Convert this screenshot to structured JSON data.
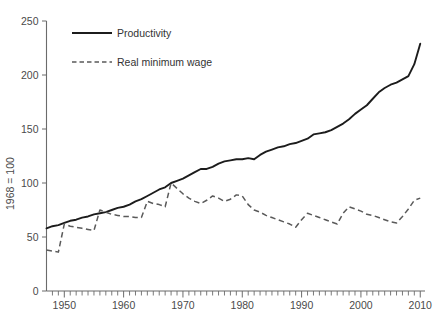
{
  "chart_data": {
    "type": "line",
    "title": "",
    "xlabel": "",
    "ylabel": "1968 = 100",
    "xlim": [
      1947,
      2010
    ],
    "ylim": [
      0,
      250
    ],
    "grid": false,
    "legend_position": "top-left",
    "y_ticks": [
      0,
      50,
      100,
      150,
      200,
      250
    ],
    "y_tick_labels": [
      "0",
      "50",
      "100",
      "150",
      "200",
      "250"
    ],
    "x_ticks": [
      1950,
      1960,
      1970,
      1980,
      1990,
      2000,
      2010
    ],
    "x_tick_labels": [
      "1950",
      "1960",
      "1970",
      "1980",
      "1990",
      "2000",
      "2010"
    ],
    "x_minor_tick_interval": 1,
    "series": [
      {
        "name": "Productivity",
        "style": "solid",
        "color": "#1c1c1c",
        "x": [
          1947,
          1948,
          1949,
          1950,
          1951,
          1952,
          1953,
          1954,
          1955,
          1956,
          1957,
          1958,
          1959,
          1960,
          1961,
          1962,
          1963,
          1964,
          1965,
          1966,
          1967,
          1968,
          1969,
          1970,
          1971,
          1972,
          1973,
          1974,
          1975,
          1976,
          1977,
          1978,
          1979,
          1980,
          1981,
          1982,
          1983,
          1984,
          1985,
          1986,
          1987,
          1988,
          1989,
          1990,
          1991,
          1992,
          1993,
          1994,
          1995,
          1996,
          1997,
          1998,
          1999,
          2000,
          2001,
          2002,
          2003,
          2004,
          2005,
          2006,
          2007,
          2008,
          2009,
          2010
        ],
        "y": [
          58,
          60,
          61,
          63,
          65,
          66,
          68,
          69,
          71,
          72,
          73,
          75,
          77,
          78,
          80,
          83,
          85,
          88,
          91,
          94,
          96,
          100,
          102,
          104,
          107,
          110,
          113,
          113,
          115,
          118,
          120,
          121,
          122,
          122,
          123,
          122,
          126,
          129,
          131,
          133,
          134,
          136,
          137,
          139,
          141,
          145,
          146,
          147,
          149,
          152,
          155,
          159,
          164,
          168,
          172,
          178,
          184,
          188,
          191,
          193,
          196,
          199,
          210,
          229
        ]
      },
      {
        "name": "Real minimum wage",
        "style": "dashed",
        "color": "#5a5a5a",
        "x": [
          1947,
          1948,
          1949,
          1950,
          1951,
          1952,
          1953,
          1954,
          1955,
          1956,
          1957,
          1958,
          1959,
          1960,
          1961,
          1962,
          1963,
          1964,
          1965,
          1966,
          1967,
          1968,
          1969,
          1970,
          1971,
          1972,
          1973,
          1974,
          1975,
          1976,
          1977,
          1978,
          1979,
          1980,
          1981,
          1982,
          1983,
          1984,
          1985,
          1986,
          1987,
          1988,
          1989,
          1990,
          1991,
          1992,
          1993,
          1994,
          1995,
          1996,
          1997,
          1998,
          1999,
          2000,
          2001,
          2002,
          2003,
          2004,
          2005,
          2006,
          2007,
          2008,
          2009,
          2010
        ],
        "y": [
          38,
          37,
          36,
          62,
          60,
          59,
          58,
          57,
          56,
          75,
          73,
          71,
          70,
          69,
          69,
          68,
          68,
          83,
          81,
          80,
          78,
          100,
          95,
          90,
          86,
          83,
          81,
          84,
          88,
          86,
          83,
          85,
          89,
          88,
          80,
          75,
          73,
          70,
          68,
          66,
          64,
          62,
          59,
          66,
          72,
          70,
          68,
          66,
          64,
          62,
          72,
          78,
          76,
          74,
          71,
          70,
          68,
          66,
          64,
          63,
          69,
          76,
          84,
          86
        ]
      }
    ]
  },
  "legend": {
    "items": [
      {
        "label": "Productivity"
      },
      {
        "label": "Real minimum wage"
      }
    ]
  },
  "axes": {
    "y_title": "1968 = 100"
  }
}
